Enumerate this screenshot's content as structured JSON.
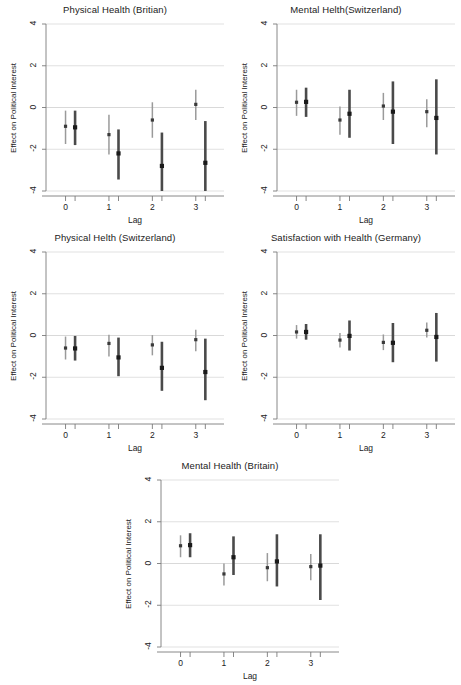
{
  "figure": {
    "axis_labels": {
      "x": "Lag",
      "y": "Effect on Political Interest"
    },
    "y_ticks": [
      "4",
      "2",
      "0",
      "-2",
      "-4"
    ],
    "x_ticks": [
      "0",
      "1",
      "2",
      "3"
    ]
  },
  "chart_data": [
    {
      "type": "scatter",
      "panel_index": 0,
      "title": "Physical Health (Britian)",
      "xlabel": "Lag",
      "ylabel": "Effect on Political Interest",
      "ylim": [
        -4,
        4
      ],
      "xlim": [
        -0.45,
        3.65
      ],
      "yticks": [
        4,
        2,
        0,
        -2,
        -4
      ],
      "xticks": [
        0,
        1,
        2,
        3
      ],
      "grid": true,
      "legend": "none",
      "series": [
        {
          "name": "estimate-a",
          "style": "light",
          "x": [
            0,
            1,
            2,
            3
          ],
          "values": [
            -0.9,
            -1.3,
            -0.6,
            0.15
          ],
          "ci_low": [
            -1.75,
            -2.25,
            -1.45,
            -0.6
          ],
          "ci_high": [
            -0.15,
            -0.35,
            0.25,
            0.85
          ]
        },
        {
          "name": "estimate-b",
          "style": "dark",
          "x": [
            0.22,
            1.22,
            2.22,
            3.22
          ],
          "values": [
            -0.95,
            -2.2,
            -2.8,
            -2.65
          ],
          "ci_low": [
            -1.8,
            -3.45,
            -4.0,
            -4.0
          ],
          "ci_high": [
            -0.15,
            -1.05,
            -1.2,
            -0.65
          ]
        }
      ]
    },
    {
      "type": "scatter",
      "panel_index": 1,
      "title": "Mental Helth(Switzerland)",
      "xlabel": "Lag",
      "ylabel": "Effect on Political Interest",
      "ylim": [
        -4,
        4
      ],
      "xlim": [
        -0.45,
        3.65
      ],
      "yticks": [
        4,
        2,
        0,
        -2,
        -4
      ],
      "xticks": [
        0,
        1,
        2,
        3
      ],
      "grid": true,
      "legend": "none",
      "series": [
        {
          "name": "estimate-a",
          "style": "light",
          "x": [
            0,
            1,
            2,
            3
          ],
          "values": [
            0.25,
            -0.6,
            0.07,
            -0.2
          ],
          "ci_low": [
            -0.4,
            -1.3,
            -0.6,
            -0.95
          ],
          "ci_high": [
            0.85,
            0.05,
            0.7,
            0.4
          ]
        },
        {
          "name": "estimate-b",
          "style": "dark",
          "x": [
            0.22,
            1.22,
            2.22,
            3.22
          ],
          "values": [
            0.27,
            -0.3,
            -0.2,
            -0.5
          ],
          "ci_low": [
            -0.45,
            -1.45,
            -1.75,
            -2.25
          ],
          "ci_high": [
            0.95,
            0.85,
            1.25,
            1.35
          ]
        }
      ]
    },
    {
      "type": "scatter",
      "panel_index": 2,
      "title": "Physical Helth (Switzerland)",
      "xlabel": "Lag",
      "ylabel": "Effect on Political Interest",
      "ylim": [
        -4,
        4
      ],
      "xlim": [
        -0.45,
        3.65
      ],
      "yticks": [
        4,
        2,
        0,
        -2,
        -4
      ],
      "xticks": [
        0,
        1,
        2,
        3
      ],
      "grid": true,
      "legend": "none",
      "series": [
        {
          "name": "estimate-a",
          "style": "light",
          "x": [
            0,
            1,
            2,
            3
          ],
          "values": [
            -0.6,
            -0.38,
            -0.45,
            -0.2
          ],
          "ci_low": [
            -1.15,
            -1.0,
            -0.95,
            -0.75
          ],
          "ci_high": [
            -0.05,
            0.03,
            0.02,
            0.28
          ]
        },
        {
          "name": "estimate-b",
          "style": "dark",
          "x": [
            0.22,
            1.22,
            2.22,
            3.22
          ],
          "values": [
            -0.62,
            -1.05,
            -1.55,
            -1.75
          ],
          "ci_low": [
            -1.2,
            -1.95,
            -2.65,
            -3.1
          ],
          "ci_high": [
            -0.02,
            -0.1,
            -0.3,
            -0.15
          ]
        }
      ]
    },
    {
      "type": "scatter",
      "panel_index": 3,
      "title": "Satisfaction with Health (Germany)",
      "xlabel": "Lag",
      "ylabel": "Effect on Political Interest",
      "ylim": [
        -4,
        4
      ],
      "xlim": [
        -0.45,
        3.65
      ],
      "yticks": [
        4,
        2,
        0,
        -2,
        -4
      ],
      "xticks": [
        0,
        1,
        2,
        3
      ],
      "grid": true,
      "legend": "none",
      "series": [
        {
          "name": "estimate-a",
          "style": "light",
          "x": [
            0,
            1,
            2,
            3
          ],
          "values": [
            0.17,
            -0.22,
            -0.33,
            0.25
          ],
          "ci_low": [
            -0.15,
            -0.58,
            -0.7,
            -0.1
          ],
          "ci_high": [
            0.5,
            0.12,
            0.05,
            0.62
          ]
        },
        {
          "name": "estimate-b",
          "style": "dark",
          "x": [
            0.22,
            1.22,
            2.22,
            3.22
          ],
          "values": [
            0.17,
            -0.02,
            -0.35,
            -0.07
          ],
          "ci_low": [
            -0.2,
            -0.72,
            -1.28,
            -1.25
          ],
          "ci_high": [
            0.55,
            0.72,
            0.6,
            1.08
          ]
        }
      ]
    },
    {
      "type": "scatter",
      "panel_index": 4,
      "title": "Mental Health (Britain)",
      "xlabel": "Lag",
      "ylabel": "Effect on Political Interest",
      "ylim": [
        -4,
        4
      ],
      "xlim": [
        -0.45,
        3.65
      ],
      "yticks": [
        4,
        2,
        0,
        -2,
        -4
      ],
      "xticks": [
        0,
        1,
        2,
        3
      ],
      "grid": true,
      "legend": "none",
      "series": [
        {
          "name": "estimate-a",
          "style": "light",
          "x": [
            0,
            1,
            2,
            3
          ],
          "values": [
            0.85,
            -0.5,
            -0.2,
            -0.15
          ],
          "ci_low": [
            0.3,
            -1.05,
            -0.85,
            -0.8
          ],
          "ci_high": [
            1.35,
            0.0,
            0.5,
            0.45
          ]
        },
        {
          "name": "estimate-b",
          "style": "dark",
          "x": [
            0.22,
            1.22,
            2.22,
            3.22
          ],
          "values": [
            0.88,
            0.3,
            0.1,
            -0.1
          ],
          "ci_low": [
            0.3,
            -0.55,
            -1.1,
            -1.75
          ],
          "ci_high": [
            1.45,
            1.3,
            1.4,
            1.4
          ]
        }
      ]
    }
  ]
}
